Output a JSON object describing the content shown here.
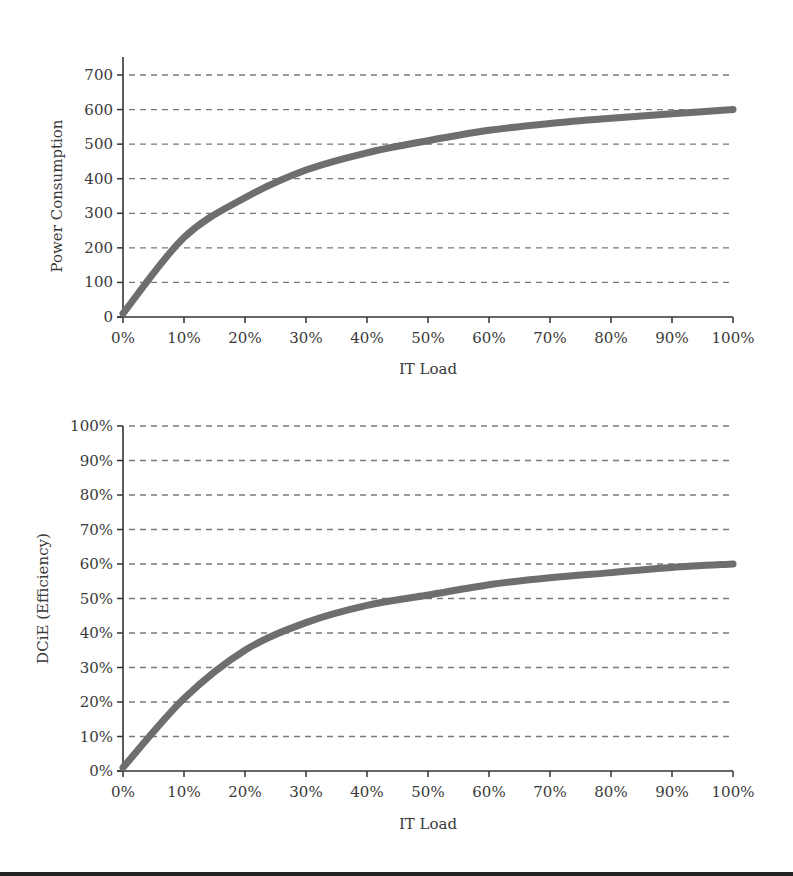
{
  "chart_data": [
    {
      "type": "line",
      "title": "",
      "xlabel": "IT Load",
      "ylabel": "Power Consumption",
      "x": [
        "0%",
        "10%",
        "20%",
        "30%",
        "40%",
        "50%",
        "60%",
        "70%",
        "80%",
        "90%",
        "100%"
      ],
      "x_ticks": [
        "0%",
        "10%",
        "20%",
        "30%",
        "40%",
        "50%",
        "60%",
        "70%",
        "80%",
        "90%",
        "100%"
      ],
      "y_ticks": [
        "0",
        "100",
        "200",
        "300",
        "400",
        "500",
        "600",
        "700"
      ],
      "ylim": [
        0,
        700
      ],
      "grid": "horizontal-dashed",
      "series": [
        {
          "name": "Power Consumption",
          "values": [
            10,
            230,
            345,
            425,
            475,
            510,
            540,
            560,
            575,
            588,
            600
          ]
        }
      ]
    },
    {
      "type": "line",
      "title": "",
      "xlabel": "IT Load",
      "ylabel": "DCiE (Efficiency)",
      "x": [
        "0%",
        "10%",
        "20%",
        "30%",
        "40%",
        "50%",
        "60%",
        "70%",
        "80%",
        "90%",
        "100%"
      ],
      "x_ticks": [
        "0%",
        "10%",
        "20%",
        "30%",
        "40%",
        "50%",
        "60%",
        "70%",
        "80%",
        "90%",
        "100%"
      ],
      "y_ticks": [
        "0%",
        "10%",
        "20%",
        "30%",
        "40%",
        "50%",
        "60%",
        "70%",
        "80%",
        "90%",
        "100%"
      ],
      "ylim": [
        0,
        100
      ],
      "grid": "horizontal-dashed",
      "series": [
        {
          "name": "DCiE (Efficiency)",
          "values": [
            1,
            21,
            35,
            43,
            48,
            51,
            54,
            56,
            57.5,
            59,
            60
          ]
        }
      ]
    }
  ],
  "colors": {
    "line": "#6e6e6e",
    "grid": "#7a7a7a",
    "axis": "#333333"
  }
}
